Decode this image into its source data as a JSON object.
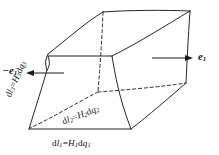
{
  "figure": {
    "kind": "curvilinear-volume-element",
    "background_color": "#ffffff",
    "line_color": "#1a1a1a",
    "labels": {
      "dl1": {
        "lhs": "d",
        "lhs_var": "l",
        "lhs_sub": "1",
        "eq": "=",
        "rhs_h": "H",
        "rhs_h_sub": "1",
        "rhs_d": "d",
        "rhs_q": "q",
        "rhs_q_sub": "1",
        "text": "dl1=H1dq1"
      },
      "dl2": {
        "lhs": "d",
        "lhs_var": "l",
        "lhs_sub": "2",
        "eq": "=",
        "rhs_h": "H",
        "rhs_h_sub": "2",
        "rhs_d": "d",
        "rhs_q": "q",
        "rhs_q_sub": "2",
        "text": "dl2=H2dq2"
      },
      "dl3": {
        "lhs": "d",
        "lhs_var": "l",
        "lhs_sub": "3",
        "eq": "=",
        "rhs_h": "H",
        "rhs_h_sub": "3",
        "rhs_d": "d",
        "rhs_q": "q",
        "rhs_q_sub": "3",
        "text": "dl3=H3dq3"
      },
      "e1_positive": {
        "sign": "",
        "symbol": "e",
        "sub": "1",
        "text": "e1"
      },
      "e1_negative": {
        "sign": "−",
        "symbol": "e",
        "sub": "1",
        "text": "-e1"
      }
    },
    "arrows": {
      "right": {
        "direction": "right",
        "label_ref": "e1_positive"
      },
      "left": {
        "direction": "left",
        "label_ref": "e1_negative"
      }
    }
  }
}
